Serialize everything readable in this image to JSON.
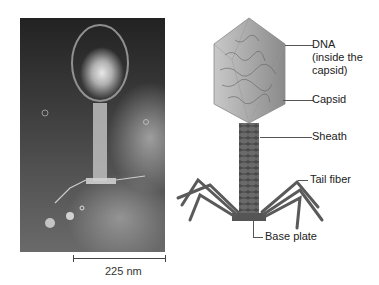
{
  "figure": {
    "micrograph": {
      "description": "Electron micrograph of bacteriophage",
      "scale_bar_label": "225 nm"
    },
    "illustration": {
      "description": "Bacteriophage structure diagram",
      "labels": {
        "dna_line1": "DNA",
        "dna_line2": "(inside the",
        "dna_line3": "capsid)",
        "capsid": "Capsid",
        "sheath": "Sheath",
        "tail_fiber": "Tail fiber",
        "base_plate": "Base plate"
      }
    }
  }
}
